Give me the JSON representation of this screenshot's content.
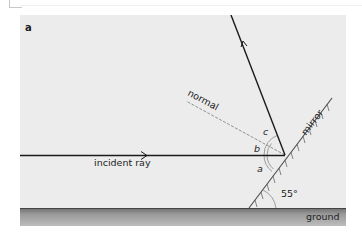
{
  "figure": {
    "panel_label": "a",
    "labels": {
      "incident_ray": "incident ray",
      "normal": "normal",
      "mirror": "mirror",
      "ground": "ground",
      "angle_a": "a",
      "angle_b": "b",
      "angle_c": "c",
      "mirror_angle": "55°"
    },
    "colors": {
      "panel_bg": "#ececec",
      "ray": "#1a1a1a",
      "normal": "#777777",
      "mirror": "#555555",
      "ground_top": "#6e6e6e",
      "ground_bottom": "#b4b4b4"
    }
  }
}
